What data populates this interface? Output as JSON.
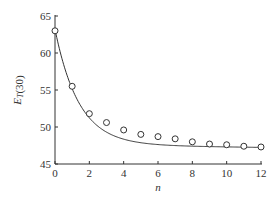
{
  "chart_data": {
    "type": "scatter",
    "title": "",
    "xlabel": "n",
    "ylabel_main": "E",
    "ylabel_sub": "T",
    "ylabel_suffix": "(30)",
    "xlim": [
      0,
      12
    ],
    "ylim": [
      45,
      65
    ],
    "xticks": [
      0,
      2,
      4,
      6,
      8,
      10,
      12
    ],
    "yticks": [
      45,
      50,
      55,
      60,
      65
    ],
    "grid": false,
    "legend": "none",
    "series": [
      {
        "name": "measured",
        "marker": "open-circle",
        "x": [
          0,
          1,
          2,
          3,
          4,
          5,
          6,
          7,
          8,
          9,
          10,
          11,
          12
        ],
        "y": [
          63.0,
          55.5,
          51.8,
          50.6,
          49.6,
          49.0,
          48.7,
          48.4,
          48.0,
          47.7,
          47.6,
          47.4,
          47.3
        ]
      },
      {
        "name": "fit",
        "style": "line",
        "model": "exponential-decay",
        "params": {
          "y_inf": 47.6,
          "amplitude": 15.6,
          "rate": 0.72,
          "linear": -0.03
        }
      }
    ]
  },
  "colors": {
    "ink": "#333333",
    "background": "#ffffff"
  }
}
